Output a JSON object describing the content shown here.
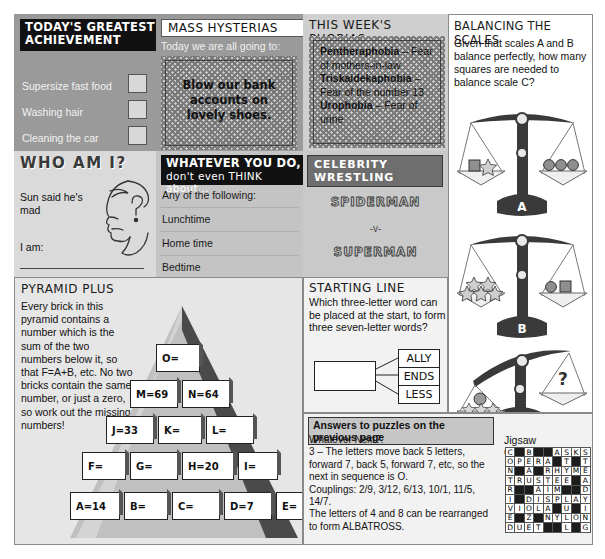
{
  "achievement": {
    "title_line1": "TODAY'S GREATEST",
    "title_line2": "ACHIEVEMENT",
    "items": [
      "Supersize fast food",
      "Washing hair",
      "Cleaning the car"
    ]
  },
  "hysterias": {
    "title": "MASS HYSTERIAS",
    "lead": "Today we are all going to:",
    "answer": "Blow our bank accounts on lovely shoes."
  },
  "phobias": {
    "title": "THIS WEEK'S PHOBIAS",
    "entries": [
      {
        "name": "Pentheraphobia",
        "desc": " – Fear of mothers-in-law"
      },
      {
        "name": "Triskaidekaphobia",
        "desc": " – Fear of the number 13"
      },
      {
        "name": "Urophobia",
        "desc": " – Fear of urine"
      }
    ]
  },
  "scales": {
    "title": "BALANCING THE SCALES",
    "question": "Given that scales A and B balance perfectly, how many squares are needed to balance scale C?",
    "labels": [
      "A",
      "B",
      "C"
    ],
    "unknown": "?",
    "scale_a": {
      "left": "square + star",
      "right": "3 circles"
    },
    "scale_b": {
      "left": "5 stars",
      "right": "circle + square"
    },
    "scale_c": {
      "left": "circle + stars",
      "right": "?"
    }
  },
  "whoami": {
    "title": "WHO AM I?",
    "clue": "Sun said he's mad",
    "answer_label": "I am:",
    "face_icon": "profile-face-question-icon"
  },
  "whatever": {
    "title_line1": "WHATEVER YOU DO,",
    "title_line2": "don't even THINK about...",
    "lead": "Any of the following:",
    "items": [
      "Lunchtime",
      "Home time",
      "Bedtime"
    ]
  },
  "wrestling": {
    "title": "CELEBRITY WRESTLING",
    "fighter1": "SPIDERMAN",
    "versus": "-v-",
    "fighter2": "SUPERMAN"
  },
  "pyramid": {
    "title": "PYRAMID PLUS",
    "text": "Every brick in this pyramid contains a number which is the sum of the two numbers below it, so that F=A+B, etc. No two bricks contain the same number, or just a zero, so work out the missing numbers!",
    "rows": [
      [
        "O="
      ],
      [
        "M=69",
        "N=64"
      ],
      [
        "J=33",
        "K=",
        "L="
      ],
      [
        "F=",
        "G=",
        "H=20",
        "I="
      ],
      [
        "A=14",
        "B=",
        "C=",
        "D=7",
        "E="
      ]
    ]
  },
  "starting": {
    "title": "STARTING LINE",
    "question": "Which three-letter word can be placed at the start, to form three seven-letter words?",
    "words": [
      "ALLY",
      "ENDS",
      "LESS"
    ]
  },
  "answers": {
    "banner": "Answers to puzzles on the previous page",
    "body": "Whatever Next?:\n3 – The letters move back 5 letters, forward 7, back 5, forward 7, etc, so the next in sequence is O.\nCouplings: 2/9, 3/12, 6/13, 10/1, 11/5, 14/7.\nThe letters of 4 and 8 can be rearranged to form ALBATROSS.",
    "jigsaw_label": "Jigsaw Crossword:",
    "jigsaw_grid": [
      [
        "C",
        "",
        "B",
        "",
        "",
        "A",
        "S",
        "K",
        "S"
      ],
      [
        "O",
        "P",
        "E",
        "R",
        "A",
        "",
        "T",
        "",
        "T"
      ],
      [
        "N",
        "",
        "A",
        "",
        "R",
        "H",
        "Y",
        "M",
        "E"
      ],
      [
        "T",
        "R",
        "U",
        "S",
        "T",
        "E",
        "E",
        "",
        "A"
      ],
      [
        "R",
        "",
        "",
        "A",
        "I",
        "M",
        "",
        "",
        "D"
      ],
      [
        "I",
        "",
        "D",
        "I",
        "S",
        "P",
        "L",
        "A",
        "Y"
      ],
      [
        "V",
        "I",
        "O",
        "L",
        "A",
        "",
        "U",
        "",
        "I"
      ],
      [
        "E",
        "",
        "Z",
        "",
        "N",
        "Y",
        "L",
        "O",
        "N"
      ],
      [
        "D",
        "U",
        "E",
        "T",
        "",
        "",
        "L",
        "",
        "G"
      ]
    ]
  }
}
